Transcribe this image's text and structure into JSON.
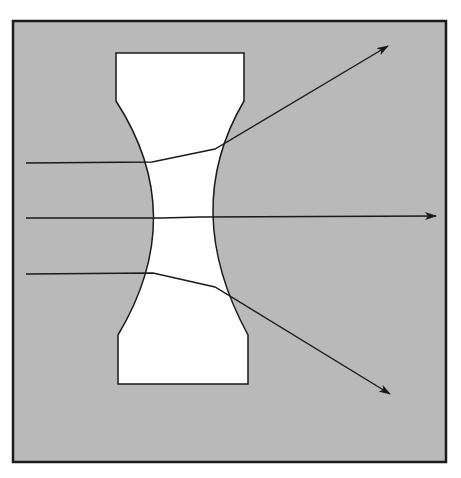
{
  "diagram": {
    "type": "optics-ray-diagram",
    "colors": {
      "page_background": "#ffffff",
      "frame_fill": "#b9b9b9",
      "frame_stroke": "#1a1a1a",
      "lens_fill": "#ffffff",
      "lens_stroke": "#1a1a1a",
      "ray_stroke": "#1a1a1a"
    },
    "frame": {
      "x": 13,
      "y": 21,
      "width": 433,
      "height": 441
    },
    "lens": {
      "label": "biconcave lens",
      "path": "M116,53 L244,53 L244,101 Q180,210 248,335 L248,384 L118,384 L118,335 Q190,215 116,101 Z"
    },
    "rays": [
      {
        "name": "upper-ray",
        "points": [
          [
            26,
            163
          ],
          [
            152,
            162
          ],
          [
            215,
            149
          ],
          [
            388,
            46
          ]
        ],
        "arrow": true
      },
      {
        "name": "axial-ray",
        "points": [
          [
            26,
            218
          ],
          [
            161,
            218
          ],
          [
            201,
            217
          ],
          [
            436,
            216
          ]
        ],
        "arrow": true
      },
      {
        "name": "lower-ray",
        "points": [
          [
            26,
            274
          ],
          [
            153,
            273
          ],
          [
            215,
            287
          ],
          [
            390,
            394
          ]
        ],
        "arrow": true
      }
    ]
  }
}
